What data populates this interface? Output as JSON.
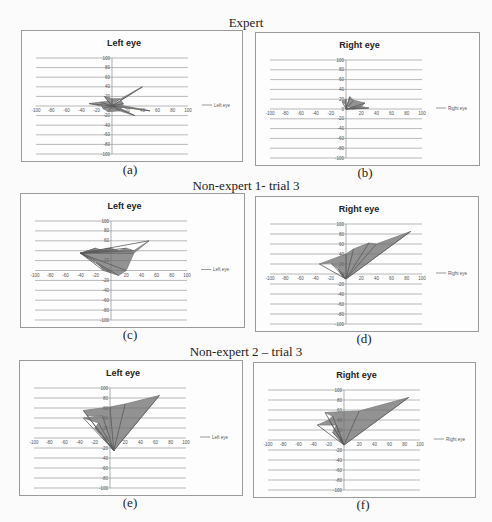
{
  "figure": {
    "sections": [
      {
        "title": "Expert"
      },
      {
        "title": "Non-expert 1- trial 3"
      },
      {
        "title": "Non-expert 2 – trial 3"
      }
    ],
    "captions": [
      "(a)",
      "(b)",
      "(c)",
      "(d)",
      "(e)",
      "(f)"
    ]
  },
  "chart_data": [
    {
      "id": "a",
      "type": "line",
      "group": "Expert",
      "title": "Left eye",
      "legend": [
        "Left eye"
      ],
      "legend_position": "right",
      "xlim": [
        -100,
        100
      ],
      "ylim": [
        -100,
        100
      ],
      "xticks": [
        -100,
        -80,
        -60,
        -40,
        -20,
        0,
        20,
        40,
        60,
        80,
        100
      ],
      "yticks": [
        100,
        80,
        60,
        40,
        20,
        0,
        -20,
        -40,
        -60,
        -80,
        -100
      ],
      "grid": "horizontal",
      "description": "Dense gaze cluster around origin, radius ~15, with short spikes reaching ~(40,40), (50,-10), (30,-20), (-30,5).",
      "series": [
        {
          "name": "Left eye",
          "color": "#7f7f7f",
          "points": [
            [
              0,
              0
            ],
            [
              40,
              40
            ],
            [
              0,
              5
            ],
            [
              50,
              -10
            ],
            [
              5,
              0
            ],
            [
              30,
              -20
            ],
            [
              0,
              -5
            ],
            [
              -30,
              5
            ],
            [
              -5,
              10
            ],
            [
              -10,
              20
            ],
            [
              0,
              15
            ],
            [
              10,
              15
            ],
            [
              15,
              5
            ],
            [
              10,
              -10
            ],
            [
              -5,
              -12
            ],
            [
              -12,
              -5
            ],
            [
              -15,
              8
            ],
            [
              0,
              0
            ]
          ]
        }
      ]
    },
    {
      "id": "b",
      "type": "line",
      "group": "Expert",
      "title": "Right eye",
      "legend": [
        "Right eye"
      ],
      "legend_position": "right",
      "xlim": [
        -100,
        100
      ],
      "ylim": [
        -100,
        100
      ],
      "xticks": [
        -100,
        -80,
        -60,
        -40,
        -20,
        0,
        20,
        40,
        60,
        80,
        100
      ],
      "yticks": [
        100,
        80,
        60,
        40,
        20,
        0,
        -20,
        -40,
        -60,
        -80,
        -100
      ],
      "grid": "horizontal",
      "description": "Small cluster in upper-right near origin, roughly x 0..25, y 0..25.",
      "series": [
        {
          "name": "Right eye",
          "color": "#7f7f7f",
          "points": [
            [
              0,
              0
            ],
            [
              5,
              25
            ],
            [
              10,
              18
            ],
            [
              25,
              12
            ],
            [
              20,
              5
            ],
            [
              30,
              2
            ],
            [
              10,
              0
            ],
            [
              0,
              8
            ],
            [
              -5,
              15
            ],
            [
              0,
              20
            ],
            [
              0,
              0
            ]
          ]
        }
      ]
    },
    {
      "id": "c",
      "type": "line",
      "group": "Non-expert 1- trial 3",
      "title": "Left eye",
      "legend": [
        "Left eye"
      ],
      "legend_position": "right",
      "xlim": [
        -100,
        100
      ],
      "ylim": [
        -100,
        100
      ],
      "xticks": [
        -100,
        -80,
        -60,
        -40,
        -20,
        0,
        20,
        40,
        60,
        80,
        100
      ],
      "yticks": [
        100,
        80,
        60,
        40,
        20,
        0,
        -20,
        -40,
        -60,
        -80,
        -100
      ],
      "grid": "horizontal",
      "description": "Wide funnel-shaped cluster, x -40..50, y -10..60, peak at ~(50,60).",
      "series": [
        {
          "name": "Left eye",
          "color": "#7f7f7f",
          "points": [
            [
              -40,
              35
            ],
            [
              -20,
              45
            ],
            [
              -10,
              40
            ],
            [
              0,
              45
            ],
            [
              10,
              40
            ],
            [
              20,
              45
            ],
            [
              30,
              40
            ],
            [
              50,
              60
            ],
            [
              30,
              35
            ],
            [
              20,
              0
            ],
            [
              10,
              -10
            ],
            [
              0,
              -5
            ],
            [
              -10,
              0
            ],
            [
              -20,
              20
            ],
            [
              -40,
              35
            ]
          ]
        }
      ]
    },
    {
      "id": "d",
      "type": "line",
      "group": "Non-expert 1- trial 3",
      "title": "Right eye",
      "legend": [
        "Right eye"
      ],
      "legend_position": "right",
      "xlim": [
        -100,
        100
      ],
      "ylim": [
        -100,
        100
      ],
      "xticks": [
        -100,
        -80,
        -60,
        -40,
        -20,
        0,
        20,
        40,
        60,
        80,
        100
      ],
      "yticks": [
        100,
        80,
        60,
        40,
        20,
        0,
        -20,
        -40,
        -60,
        -80,
        -100
      ],
      "grid": "horizontal",
      "description": "Fan of lines from near origin to ~(85,85), with outlines reaching (-35,20) and (30,62).",
      "series": [
        {
          "name": "Right eye",
          "color": "#7f7f7f",
          "points": [
            [
              0,
              -10
            ],
            [
              85,
              85
            ],
            [
              40,
              60
            ],
            [
              30,
              62
            ],
            [
              10,
              50
            ],
            [
              0,
              40
            ],
            [
              -35,
              20
            ],
            [
              -20,
              22
            ],
            [
              -10,
              10
            ],
            [
              -5,
              -5
            ],
            [
              0,
              -10
            ]
          ]
        }
      ]
    },
    {
      "id": "e",
      "type": "line",
      "group": "Non-expert 2 – trial 3",
      "title": "Left eye",
      "legend": [
        "Left eye"
      ],
      "legend_position": "right",
      "xlim": [
        -100,
        100
      ],
      "ylim": [
        -100,
        100
      ],
      "xticks": [
        -100,
        -80,
        -60,
        -40,
        -20,
        0,
        20,
        40,
        60,
        80,
        100
      ],
      "yticks": [
        100,
        80,
        60,
        40,
        20,
        0,
        -20,
        -40,
        -60,
        -80,
        -100
      ],
      "grid": "horizontal",
      "description": "Fan from ~(5,-25) to ~(65,85), with loops reaching (-35,55) and (20,68).",
      "series": [
        {
          "name": "Left eye",
          "color": "#7f7f7f",
          "points": [
            [
              5,
              -25
            ],
            [
              65,
              85
            ],
            [
              20,
              68
            ],
            [
              0,
              62
            ],
            [
              -35,
              55
            ],
            [
              -30,
              45
            ],
            [
              -10,
              45
            ],
            [
              -35,
              40
            ],
            [
              -15,
              30
            ],
            [
              -20,
              20
            ],
            [
              -10,
              5
            ],
            [
              0,
              -10
            ],
            [
              5,
              -25
            ]
          ]
        }
      ]
    },
    {
      "id": "f",
      "type": "line",
      "group": "Non-expert 2 – trial 3",
      "title": "Right eye",
      "legend": [
        "Right eye"
      ],
      "legend_position": "right",
      "xlim": [
        -100,
        100
      ],
      "ylim": [
        -100,
        100
      ],
      "xticks": [
        -100,
        -80,
        -60,
        -40,
        -20,
        0,
        20,
        40,
        60,
        80,
        100
      ],
      "yticks": [
        100,
        80,
        60,
        40,
        20,
        0,
        -20,
        -40,
        -60,
        -80,
        -100
      ],
      "grid": "horizontal",
      "description": "Fan from origin to ~(85,85) with stripes reaching (-25,55) and (-35,30).",
      "series": [
        {
          "name": "Right eye",
          "color": "#7f7f7f",
          "points": [
            [
              0,
              -10
            ],
            [
              85,
              85
            ],
            [
              20,
              58
            ],
            [
              -25,
              55
            ],
            [
              -15,
              48
            ],
            [
              -20,
              40
            ],
            [
              -35,
              30
            ],
            [
              -10,
              30
            ],
            [
              -15,
              15
            ],
            [
              -5,
              0
            ],
            [
              0,
              -10
            ]
          ]
        }
      ]
    }
  ]
}
